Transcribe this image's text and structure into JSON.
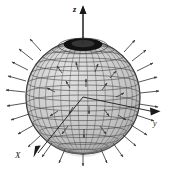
{
  "figure": {
    "background_color": "#ffffff",
    "sphere": {
      "name": "unit-sphere",
      "center_px": [
        83,
        97
      ],
      "radius_px": 57,
      "fill_color": "#c8c8c8",
      "fill_color_light": "#dcdcdc",
      "fill_color_dark": "#a8a8a8",
      "grid_color": "#4a4a4a",
      "outline_color": "#2b2b2b",
      "meridian_count": 24,
      "parallel_count": 14,
      "polar_cap": {
        "name": "north-polar-opening",
        "color": "#101010",
        "center_px": [
          83,
          44
        ],
        "rx_px": 18,
        "ry_px": 6
      }
    },
    "vectors": {
      "name": "outward-normal-field",
      "color": "#3a3a3a",
      "count": 40,
      "description": "outward-pointing normal arrows distributed over the sphere surface"
    },
    "axes": [
      {
        "id": "z",
        "label": "z",
        "direction": "up",
        "tip_px": [
          83,
          7
        ],
        "origin_px": [
          83,
          50
        ],
        "label_px": [
          74,
          10
        ],
        "color": "#1a1a1a"
      },
      {
        "id": "y",
        "label": "y",
        "direction": "right",
        "tip_px": [
          160,
          110
        ],
        "origin_px": [
          83,
          97
        ],
        "label_px": [
          156,
          124
        ],
        "color": "#1a1a1a"
      },
      {
        "id": "X",
        "label": "X",
        "direction": "down-left",
        "tip_px": [
          34,
          156
        ],
        "origin_px": [
          83,
          97
        ],
        "label_px": [
          18,
          156
        ],
        "color": "#1a1a1a"
      }
    ]
  }
}
